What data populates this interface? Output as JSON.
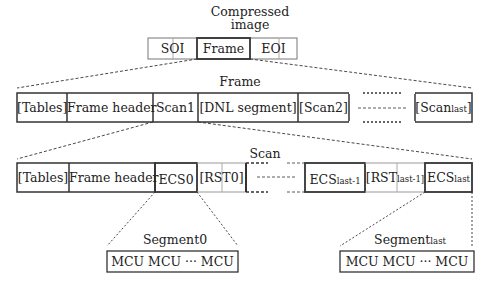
{
  "title": {
    "line1": "Compressed",
    "line2": "image"
  },
  "top_row": {
    "cells": [
      "SOI",
      "Frame",
      "EOI"
    ]
  },
  "frame": {
    "label": "Frame",
    "cells": [
      "[Tables]",
      "Frame header",
      "Scan1",
      "[DNL segment]",
      "[Scan2]",
      "",
      "[Scan"
    ],
    "scan_last_sub": "last",
    "scan_last_close": "]"
  },
  "scan": {
    "label": "Scan",
    "cells": [
      "[Tables]",
      "Frame header",
      "ECS0",
      "[RST0]"
    ],
    "ecs_prev": "ECS",
    "ecs_prev_sub": "last-1",
    "rst_prev": "[RST",
    "rst_prev_sub": "last-1]",
    "ecs_last": "ECS",
    "ecs_last_sub": "last"
  },
  "segment0": {
    "label": "Segment0",
    "content": "MCU  MCU ··· MCU"
  },
  "segment_last": {
    "label": "Segment",
    "label_sub": "last",
    "content": "MCU  MCU ··· MCU"
  }
}
